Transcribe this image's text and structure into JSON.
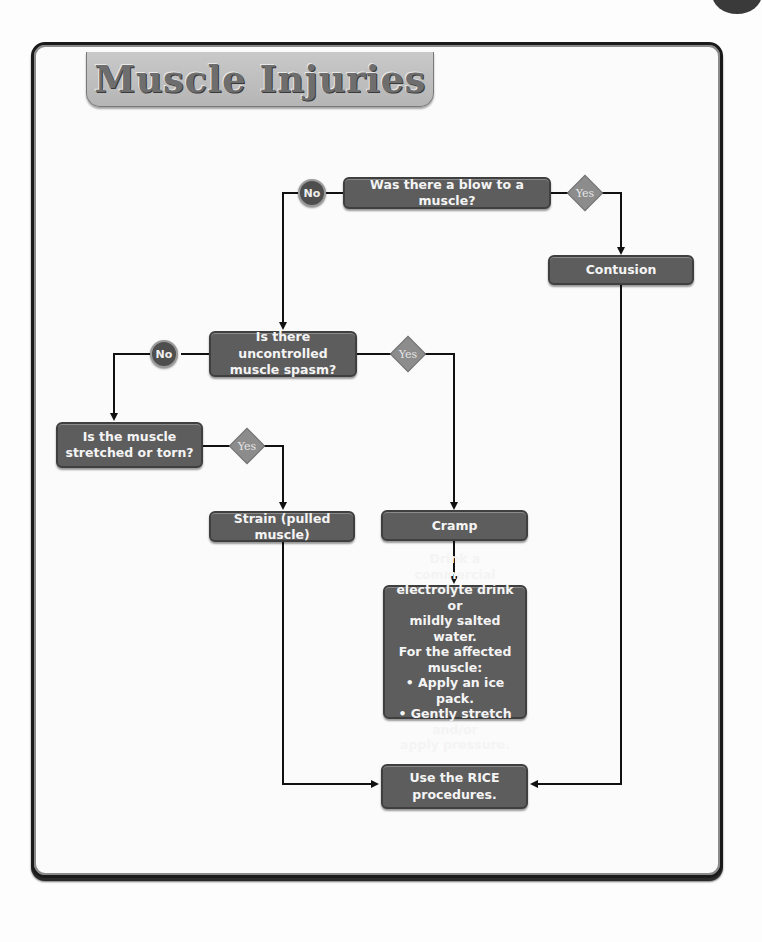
{
  "title": "Muscle Injuries",
  "colors": {
    "box_fill": "#5d5d5d",
    "no_circle": "#4e4e4e",
    "yes_diamond": "#8c8c8c",
    "title_tab": "#c0c0c0",
    "line": "#111111"
  },
  "nodes": {
    "q1": "Was there a blow to a muscle?",
    "contusion": "Contusion",
    "q2_line1": "Is there uncontrolled",
    "q2_line2": "muscle spasm?",
    "q3_line1": "Is the muscle",
    "q3_line2": "stretched or torn?",
    "strain": "Strain (pulled muscle)",
    "cramp": "Cramp",
    "cramp_care": [
      "Drink a commercial",
      "electrolyte drink or",
      "mildly salted water.",
      "For the affected",
      "muscle:",
      "• Apply an ice pack.",
      "• Gently stretch and/or",
      "apply pressure."
    ],
    "rice_line1": "Use the RICE",
    "rice_line2": "procedures."
  },
  "labels": {
    "no": "No",
    "yes": "Yes"
  }
}
